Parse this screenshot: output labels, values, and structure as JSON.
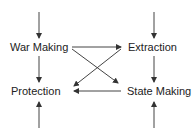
{
  "diagram": {
    "nodes": [
      {
        "id": "war_making",
        "label": "War Making"
      },
      {
        "id": "extraction",
        "label": "Extraction"
      },
      {
        "id": "protection",
        "label": "Protection"
      },
      {
        "id": "state_making",
        "label": "State Making"
      }
    ],
    "edges": [
      {
        "from": "external_top_left",
        "to": "war_making"
      },
      {
        "from": "external_top_right",
        "to": "extraction"
      },
      {
        "from": "war_making",
        "to": "protection"
      },
      {
        "from": "extraction",
        "to": "state_making"
      },
      {
        "from": "war_making",
        "to": "extraction"
      },
      {
        "from": "war_making",
        "to": "state_making"
      },
      {
        "from": "extraction",
        "to": "protection"
      },
      {
        "from": "state_making",
        "to": "protection"
      },
      {
        "from": "external_bottom_left",
        "to": "protection"
      },
      {
        "from": "external_bottom_right",
        "to": "state_making"
      }
    ]
  }
}
